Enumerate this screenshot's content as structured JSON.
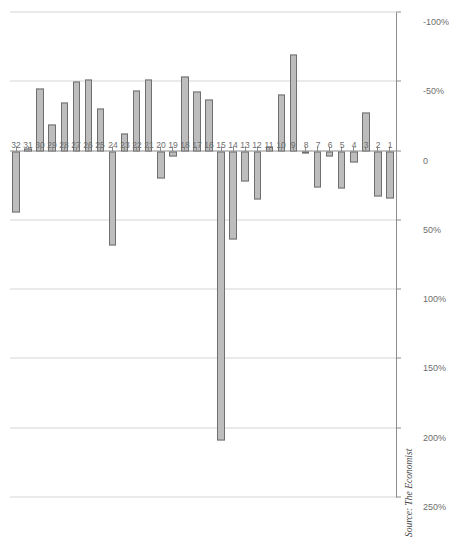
{
  "figure": {
    "source_note": "Source: The Economist",
    "orientation": "rotated-90",
    "bar_fill": "#bdbdbd",
    "bar_stroke": "#6f6f6f",
    "grid_color": "#d6d6d6",
    "axis_color": "#8d8d8d"
  },
  "chart_data": {
    "type": "bar",
    "title": "",
    "subtitle": "",
    "xlabel": "",
    "ylabel": "",
    "orientation": "horizontal",
    "grid": true,
    "legend": null,
    "axis_ticks": [
      "250%",
      "200%",
      "150%",
      "100%",
      "50%",
      "0",
      "-50%",
      "-100%"
    ],
    "axis_tick_values": [
      250,
      200,
      150,
      100,
      50,
      0,
      -50,
      -100
    ],
    "xlim": [
      -100,
      250
    ],
    "categories": [
      "1",
      "2",
      "3",
      "4",
      "5",
      "6",
      "7",
      "8",
      "9",
      "10",
      "11",
      "12",
      "13",
      "14",
      "15",
      "16",
      "17",
      "18",
      "19",
      "20",
      "21",
      "22",
      "23",
      "24",
      "25",
      "26",
      "27",
      "28",
      "29",
      "30",
      "31",
      "32"
    ],
    "values": [
      34,
      33,
      -28,
      8,
      27,
      4,
      26,
      2,
      -70,
      -41,
      -3,
      35,
      22,
      64,
      209,
      -37,
      -43,
      -54,
      4,
      20,
      -52,
      -44,
      -13,
      68,
      -31,
      -52,
      -50,
      -35,
      -19,
      -45,
      -2,
      44
    ]
  },
  "value_axis": {
    "labels": [
      "250%",
      "200%",
      "150%",
      "100%",
      "50%",
      "0",
      "-50%",
      "-100%"
    ]
  },
  "category_axis": {
    "labels": [
      "1",
      "2",
      "3",
      "4",
      "5",
      "6",
      "7",
      "8",
      "9",
      "10",
      "11",
      "12",
      "13",
      "14",
      "15",
      "16",
      "17",
      "18",
      "19",
      "20",
      "21",
      "22",
      "23",
      "24",
      "25",
      "26",
      "27",
      "28",
      "29",
      "30",
      "31",
      "32"
    ]
  }
}
